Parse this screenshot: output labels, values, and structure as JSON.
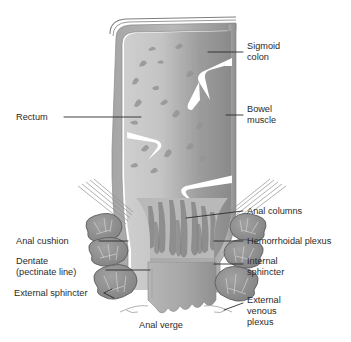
{
  "figure": {
    "background_color": "#ffffff",
    "ink_color": "#2b2b2b",
    "fills": {
      "lumen_light": "#c9c9c9",
      "lumen_dark": "#8f8f8f",
      "wall_outer": "#9a9a9a",
      "wall_mid": "#b4b4b4",
      "fold_white": "#ffffff",
      "muscle_blob": "#8d8d8d",
      "muscle_edge": "#5e5e5e",
      "column_streak": "#8a8a8a",
      "verge_fill": "#a8a8a8"
    }
  },
  "labels": {
    "sigmoid_colon": {
      "line1": "Sigmoid",
      "line2": "colon"
    },
    "bowel_muscle": {
      "line1": "Bowel",
      "line2": "muscle"
    },
    "rectum": {
      "line1": "Rectum"
    },
    "anal_columns": {
      "line1": "Anal columns"
    },
    "hemorrhoidal_plexus": {
      "line1": "Hemorrhoidal plexus"
    },
    "internal_sphincter": {
      "line1": "Internal",
      "line2": "sphincter"
    },
    "external_venous_plexus": {
      "line1": "External",
      "line2": "venous",
      "line3": "plexus"
    },
    "anal_cushion": {
      "line1": "Anal cushion"
    },
    "dentate_line": {
      "line1": "Dentate",
      "line2": "(pectinate line)"
    },
    "external_sphincter": {
      "line1": "External sphincter"
    },
    "anal_verge": {
      "line1": "Anal verge"
    }
  }
}
